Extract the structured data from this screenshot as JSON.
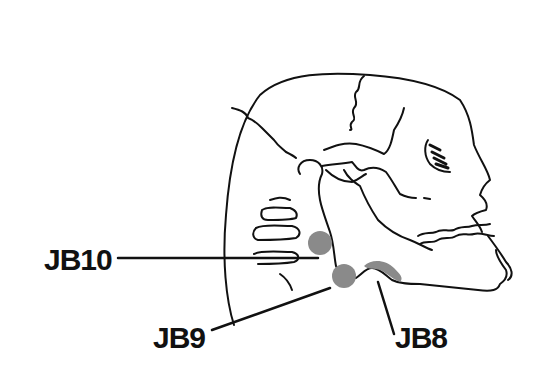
{
  "diagram": {
    "labels": [
      {
        "id": "jb10",
        "text": "JB10"
      },
      {
        "id": "jb9",
        "text": "JB9"
      },
      {
        "id": "jb8",
        "text": "JB8"
      }
    ],
    "colors": {
      "line": "#111111",
      "point_fill": "#8a8a8a",
      "background": "#ffffff"
    }
  }
}
